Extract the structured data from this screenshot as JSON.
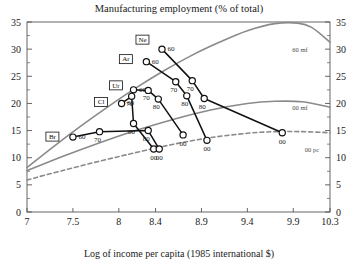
{
  "chart_data": {
    "type": "line",
    "title": "Manufacturing employment (% of total)",
    "xlabel": "Log of income per capita (1985 international $)",
    "ylabel": "",
    "xlim": [
      7,
      10.3
    ],
    "ylim": [
      0,
      35
    ],
    "grid": false,
    "legend_position": "inline-right",
    "xticks": [
      "7",
      "7.5",
      "8",
      "8.4",
      "8.9",
      "9.4",
      "9.9",
      "10.3"
    ],
    "xtick_values": [
      7,
      7.5,
      8,
      8.4,
      8.9,
      9.4,
      9.9,
      10.3
    ],
    "yticks": [
      "0",
      "5",
      "10",
      "15",
      "20",
      "25",
      "30",
      "35"
    ],
    "ytick_values": [
      0,
      5,
      10,
      15,
      20,
      25,
      30,
      35
    ],
    "right_axis_ticks": [
      "0",
      "5",
      "10",
      "15",
      "20",
      "25",
      "30",
      "35"
    ],
    "series": [
      {
        "name": "Ne",
        "label": "Ne",
        "color": "#111111",
        "style": "solid",
        "points": [
          {
            "decade": "60",
            "x": 8.47,
            "y": 30.0
          },
          {
            "decade": "70",
            "x": 8.8,
            "y": 24.2
          },
          {
            "decade": "80",
            "x": 8.93,
            "y": 20.9
          },
          {
            "decade": "00",
            "x": 9.78,
            "y": 14.6
          }
        ],
        "decade_labels": [
          "60",
          "70",
          "80",
          "00"
        ]
      },
      {
        "name": "Ar",
        "label": "Ar",
        "color": "#111111",
        "style": "solid",
        "points": [
          {
            "decade": "60",
            "x": 8.3,
            "y": 27.7
          },
          {
            "decade": "70",
            "x": 8.62,
            "y": 24.0
          },
          {
            "decade": "80",
            "x": 8.74,
            "y": 21.4
          },
          {
            "decade": "00",
            "x": 8.96,
            "y": 13.2
          }
        ],
        "decade_labels": [
          "60",
          "70",
          "80",
          "00"
        ]
      },
      {
        "name": "Ur",
        "label": "Ur",
        "color": "#111111",
        "style": "solid",
        "points": [
          {
            "decade": "60",
            "x": 8.16,
            "y": 22.5
          },
          {
            "decade": "70",
            "x": 8.32,
            "y": 22.4
          },
          {
            "decade": "80",
            "x": 8.43,
            "y": 20.8
          },
          {
            "decade": "00",
            "x": 8.7,
            "y": 14.2
          }
        ],
        "decade_labels": [
          "60",
          "70",
          "80",
          "00"
        ]
      },
      {
        "name": "Cl",
        "label": "Cl",
        "color": "#111111",
        "style": "solid",
        "points": [
          {
            "decade": "60",
            "x": 8.03,
            "y": 20.0
          },
          {
            "decade": "70",
            "x": 8.14,
            "y": 21.3
          },
          {
            "decade": "80",
            "x": 8.16,
            "y": 16.3
          },
          {
            "decade": "00",
            "x": 8.38,
            "y": 11.6
          }
        ],
        "decade_labels": [
          "60",
          "70",
          "80",
          "00"
        ]
      },
      {
        "name": "Br",
        "label": "Br",
        "color": "#111111",
        "style": "solid",
        "points": [
          {
            "decade": "60",
            "x": 7.5,
            "y": 13.8
          },
          {
            "decade": "70",
            "x": 7.79,
            "y": 14.8
          },
          {
            "decade": "80",
            "x": 8.32,
            "y": 15.0
          },
          {
            "decade": "00",
            "x": 8.44,
            "y": 11.6
          }
        ],
        "decade_labels": [
          "60",
          "70",
          "80",
          "00"
        ]
      }
    ],
    "reference_curves": [
      {
        "name": "60 mf",
        "label": "60 mf",
        "color": "#8a8a8a",
        "style": "solid",
        "description": "1960 manufacturing share fitted curve, peaks near 34.8 at x=9.6",
        "points": [
          {
            "x": 7.0,
            "y": 8.2
          },
          {
            "x": 7.3,
            "y": 12.2
          },
          {
            "x": 7.6,
            "y": 16.0
          },
          {
            "x": 7.9,
            "y": 19.6
          },
          {
            "x": 8.2,
            "y": 23.0
          },
          {
            "x": 8.5,
            "y": 26.1
          },
          {
            "x": 8.8,
            "y": 28.9
          },
          {
            "x": 9.1,
            "y": 31.3
          },
          {
            "x": 9.4,
            "y": 33.4
          },
          {
            "x": 9.7,
            "y": 34.7
          },
          {
            "x": 9.95,
            "y": 34.8
          },
          {
            "x": 10.1,
            "y": 34.0
          },
          {
            "x": 10.3,
            "y": 31.3
          }
        ]
      },
      {
        "name": "00 mf",
        "label": "00 mf",
        "color": "#8a8a8a",
        "style": "solid",
        "description": "2000 manufacturing share fitted curve, peaks near 20.5 at x=9.6",
        "points": [
          {
            "x": 7.0,
            "y": 7.6
          },
          {
            "x": 7.4,
            "y": 10.3
          },
          {
            "x": 7.8,
            "y": 12.8
          },
          {
            "x": 8.2,
            "y": 15.1
          },
          {
            "x": 8.6,
            "y": 17.1
          },
          {
            "x": 9.0,
            "y": 18.8
          },
          {
            "x": 9.4,
            "y": 20.0
          },
          {
            "x": 9.7,
            "y": 20.4
          },
          {
            "x": 10.0,
            "y": 20.3
          },
          {
            "x": 10.3,
            "y": 19.3
          }
        ]
      },
      {
        "name": "00 pc",
        "label": "00 pc",
        "color": "#8a8a8a",
        "style": "dashed",
        "description": "2000 per-capita fitted curve, flattening near 14.8",
        "points": [
          {
            "x": 7.0,
            "y": 5.9
          },
          {
            "x": 7.4,
            "y": 7.7
          },
          {
            "x": 7.8,
            "y": 9.4
          },
          {
            "x": 8.2,
            "y": 11.0
          },
          {
            "x": 8.6,
            "y": 12.5
          },
          {
            "x": 9.0,
            "y": 13.7
          },
          {
            "x": 9.4,
            "y": 14.5
          },
          {
            "x": 9.7,
            "y": 14.8
          },
          {
            "x": 10.0,
            "y": 14.8
          },
          {
            "x": 10.3,
            "y": 14.6
          }
        ]
      }
    ]
  }
}
